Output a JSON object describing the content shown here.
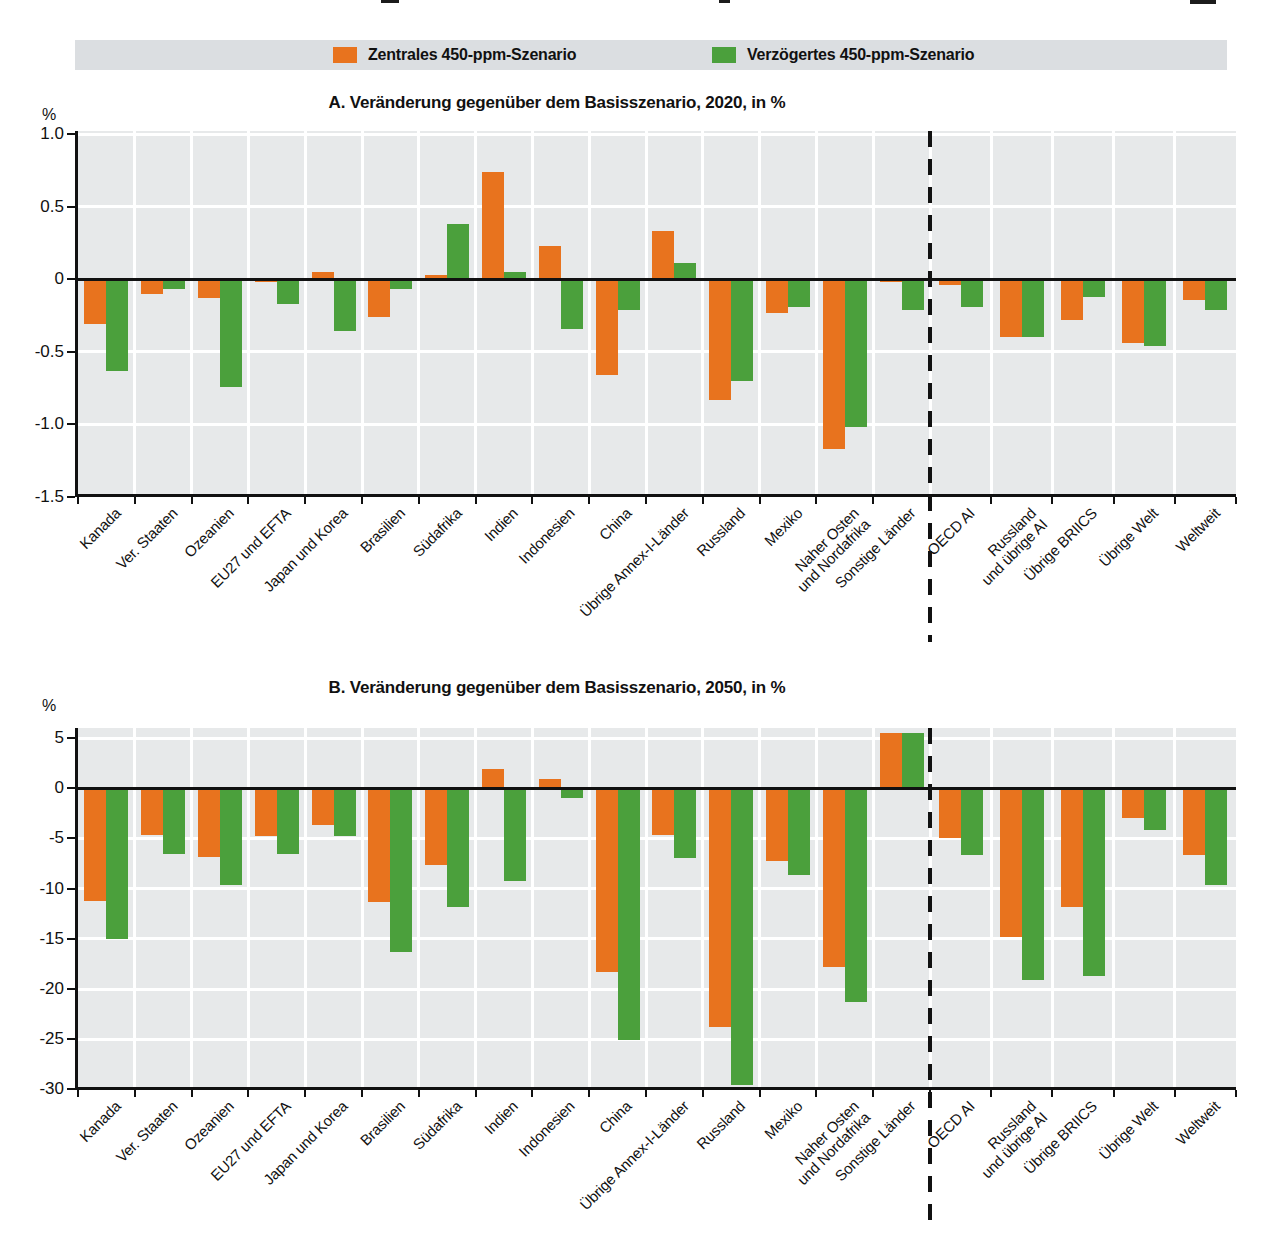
{
  "legend": {
    "items": [
      {
        "label": "Zentrales 450-ppm-Szenario",
        "color": "#e8731e"
      },
      {
        "label": "Verzögertes 450-ppm-Szenario",
        "color": "#4ba03c"
      }
    ]
  },
  "chart_data": {
    "type": "bar",
    "grid": true,
    "legend_position": "top",
    "group_separator_after": "Sonstige Länder",
    "categories": [
      "Kanada",
      "Ver. Staaten",
      "Ozeanien",
      "EU27 und EFTA",
      "Japan und Korea",
      "Brasilien",
      "Südafrika",
      "Indien",
      "Indonesien",
      "China",
      "Übrige Annex-I-Länder",
      "Russland",
      "Mexiko",
      "Naher Osten\nund Nordafrika",
      "Sonstige Länder",
      "OECD AI",
      "Russland\nund übrige AI",
      "Übrige BRIICS",
      "Übrige Welt",
      "Weltweit"
    ],
    "panels": [
      {
        "title": "A. Veränderung gegenüber dem Basisszenario, 2020, in %",
        "ylabel": "%",
        "ylim": [
          -1.5,
          1.0
        ],
        "ytick_labels": [
          "1.0",
          "0.5",
          "0",
          "-0.5",
          "-1.0",
          "-1.5"
        ],
        "ytick_values": [
          1.0,
          0.5,
          0,
          -0.5,
          -1.0,
          -1.5
        ],
        "series": [
          {
            "name": "Zentrales 450-ppm-Szenario",
            "color": "#e8731e",
            "values": [
              -0.31,
              -0.1,
              -0.13,
              -0.02,
              0.05,
              -0.26,
              0.03,
              0.74,
              0.23,
              -0.66,
              0.33,
              -0.83,
              -0.23,
              -1.17,
              -0.02,
              -0.04,
              -0.4,
              -0.28,
              -0.44,
              -0.14
            ]
          },
          {
            "name": "Verzögertes 450-ppm-Szenario",
            "color": "#4ba03c",
            "values": [
              -0.63,
              -0.07,
              -0.74,
              -0.17,
              -0.36,
              -0.07,
              0.38,
              0.05,
              -0.34,
              -0.21,
              0.11,
              -0.7,
              -0.19,
              -1.02,
              -0.21,
              -0.19,
              -0.4,
              -0.12,
              -0.46,
              -0.21
            ]
          }
        ]
      },
      {
        "title": "B. Veränderung gegenüber dem Basisszenario, 2050, in %",
        "ylabel": "%",
        "ylim": [
          -30,
          5
        ],
        "ytick_labels": [
          "5",
          "0",
          "-5",
          "-10",
          "-15",
          "-20",
          "-25",
          "-30"
        ],
        "ytick_values": [
          5,
          0,
          -5,
          -10,
          -15,
          -20,
          -25,
          -30
        ],
        "series": [
          {
            "name": "Zentrales 450-ppm-Szenario",
            "color": "#e8731e",
            "values": [
              -11.2,
              -4.7,
              -6.9,
              -4.8,
              -3.7,
              -11.3,
              -7.7,
              1.9,
              0.9,
              -18.3,
              -4.7,
              -23.8,
              -7.3,
              -17.8,
              5.5,
              -5.0,
              -14.8,
              -11.8,
              -3.0,
              -6.7
            ]
          },
          {
            "name": "Verzögertes 450-ppm-Szenario",
            "color": "#4ba03c",
            "values": [
              -15.0,
              -6.6,
              -9.6,
              -6.6,
              -4.8,
              -16.3,
              -11.8,
              -9.2,
              -1.0,
              -25.1,
              -7.0,
              -29.6,
              -8.6,
              -21.3,
              5.5,
              -6.7,
              -19.1,
              -18.7,
              -4.2,
              -9.6
            ]
          }
        ]
      }
    ]
  }
}
